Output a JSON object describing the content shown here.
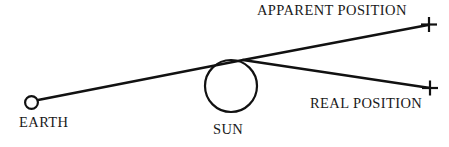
{
  "figure": {
    "type": "astronomy-light-deflection-diagram",
    "background_color": "#ffffff",
    "stroke_color": "#111111",
    "labels": {
      "earth": "EARTH",
      "sun": "SUN",
      "apparent_position": "APPARENT POSITION",
      "real_position": "REAL POSITION"
    },
    "objects": {
      "earth_body": {
        "name": "earth-circle",
        "cx": 31.5,
        "cy": 102.5,
        "r": 6.4,
        "stroke_width": 2.0,
        "fill": "none"
      },
      "sun_body": {
        "name": "sun-circle",
        "cx": 231,
        "cy": 86,
        "r": 26,
        "stroke_width": 2.0,
        "fill": "none"
      }
    },
    "rays": {
      "sight_line": {
        "name": "line-of-sight-to-apparent-position",
        "points": "38,100 243,60 428,25",
        "stroke_width": 2.4
      },
      "real_ray": {
        "name": "real-ray-to-real-position",
        "points": "243,60 430,88",
        "stroke_width": 2.4
      }
    },
    "markers": {
      "apparent_cross": {
        "name": "apparent-position-marker",
        "cx": 429,
        "cy": 24.5,
        "arm": 8,
        "stroke_width": 2.2
      },
      "real_cross": {
        "name": "real-position-marker",
        "cx": 430,
        "cy": 88,
        "arm": 8,
        "stroke_width": 2.2
      }
    }
  }
}
